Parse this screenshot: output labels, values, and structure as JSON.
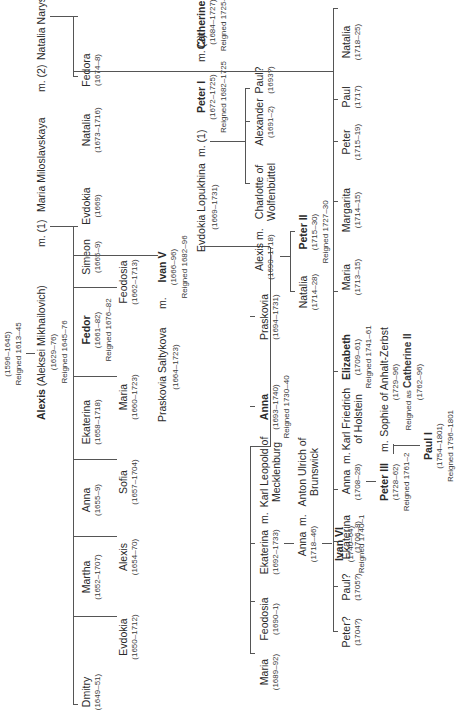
{
  "root": {
    "name": "Michael",
    "dates": "(1596–1645)",
    "reign": "Reigned 1613–45"
  },
  "alexis": {
    "name": "Alexis",
    "full": "(Aleksei Mikhailovich)",
    "dates": "(1629–76)",
    "reign": "Reigned 1645–76",
    "m1": "m. (1)",
    "wife1": "Maria Miloslavskaya",
    "m2": "m. (2)",
    "wife2": "Natalia Naryshkina"
  },
  "gen2_first_row": [
    {
      "name": "Dmitry",
      "dates": "(1649–51)"
    },
    {
      "name": "Martha",
      "dates": "(1652–1707)"
    },
    {
      "name": "Anna",
      "dates": "(1655–9)"
    },
    {
      "name": "Ekaterina",
      "dates": "(1658–1718)"
    },
    {
      "name": "Fedor",
      "dates": "(1661–82)",
      "reign": "Reigned 1676–82",
      "bold": true
    },
    {
      "name": "Simeon",
      "dates": "(1665–9)"
    },
    {
      "name": "Evdokia",
      "dates": "(1669)"
    }
  ],
  "gen2_second_row": [
    {
      "name": "Evdokia",
      "dates": "(1650–1712)"
    },
    {
      "name": "Alexis",
      "dates": "(1654–70)"
    },
    {
      "name": "Sofia",
      "dates": "(1657–1704)"
    },
    {
      "name": "Maria",
      "dates": "(1660–1723)"
    },
    {
      "name": "Feodosia",
      "dates": "(1662–1713)"
    }
  ],
  "ivan_v": {
    "spouse": "Praskovia Saltykova",
    "spouse_dates": "(1664–1723)",
    "m": "m.",
    "name": "Ivan V",
    "dates": "(1666–96)",
    "reign": "Reigned 1682–96"
  },
  "naryshkina_children": [
    {
      "name": "Natalia",
      "dates": "(1673–1716)"
    },
    {
      "name": "Fedora",
      "dates": "(1674–8)"
    }
  ],
  "peter_i": {
    "spouse1": "Evdokia Lopukhina",
    "spouse1_dates": "(1669–1731)",
    "m1": "m. (1)",
    "name": "Peter I",
    "dates": "(1672–1725)",
    "reign": "Reigned 1682–1725",
    "m2": "m. (2)",
    "spouse2": "Catherine I",
    "spouse2_dates": "(1684–1727)",
    "spouse2_reign": "Reigned 1725–7"
  },
  "ivan_v_children": [
    {
      "name": "Maria",
      "dates": "(1689–92)"
    },
    {
      "name": "Feodosia",
      "dates": "(1690–1)"
    },
    {
      "name": "Ekaterina",
      "dates": "(1692–1733)",
      "m": "m.",
      "spouse": "Karl Leopold of",
      "spouse2": "Mecklenburg"
    },
    {
      "name": "Anna",
      "dates": "(1693–1740)",
      "reign": "Reigned 1730–40",
      "bold": true
    },
    {
      "name": "Praskovia",
      "dates": "(1694–1731)"
    }
  ],
  "anna_leopoldovna": {
    "name": "Anna",
    "dates": "(1718–46)",
    "m": "m.",
    "spouse": "Anton Ulrich of",
    "spouse2": "Brunswick"
  },
  "ivan_vi": {
    "name": "Ivan VI",
    "dates": "(1740–64)",
    "reign": "Reigned 1740–1"
  },
  "lopukhina_children": [
    {
      "name": "Alexis",
      "dates": "(1690–1718)",
      "m": "m.",
      "spouse": "Charlotte of",
      "spouse2": "Wolfenbüttel"
    },
    {
      "name": "Alexander",
      "dates": "(1691–2)"
    },
    {
      "name": "Paul?",
      "dates": "(1693?)"
    }
  ],
  "alexis_children": [
    {
      "name": "Natalia",
      "dates": "(1714–28)"
    },
    {
      "name": "Peter II",
      "dates": "(1715–30)",
      "reign": "Reigned 1727–30",
      "bold": true
    }
  ],
  "catherine_children": [
    {
      "name": "Peter?",
      "dates": "(1704?)"
    },
    {
      "name": "Paul?",
      "dates": "(1705?)"
    },
    {
      "name": "Ekaterina",
      "dates": "(1706–8)"
    },
    {
      "name": "Anna",
      "dates": "(1708–28)",
      "m": "m.",
      "spouse": "Karl Friedrich",
      "spouse2": "of Holstein"
    },
    {
      "name": "Elizabeth",
      "dates": "(1709–61)",
      "reign": "Reigned 1741–61",
      "bold": true
    },
    {
      "name": "Maria",
      "dates": "(1713–15)"
    },
    {
      "name": "Margarita",
      "dates": "(1714–15)"
    },
    {
      "name": "Peter",
      "dates": "(1715–19)"
    },
    {
      "name": "Paul",
      "dates": "(1717)"
    },
    {
      "name": "Natalia",
      "dates": "(1718–25)"
    }
  ],
  "peter_iii": {
    "name": "Peter III",
    "dates": "(1728–62)",
    "reign": "Reigned 1761–2",
    "m": "m.",
    "spouse": "Sophie of Anhalt-Zerbst",
    "spouse_dates": "(1729–96)",
    "spouse_reign_prefix": "Reigned as",
    "spouse_reign_name": "Catherine II",
    "spouse_reign_dates": "(1762–96)"
  },
  "paul_i": {
    "name": "Paul I",
    "dates": "(1754–1801)",
    "reign": "Reigned 1796–1801"
  }
}
